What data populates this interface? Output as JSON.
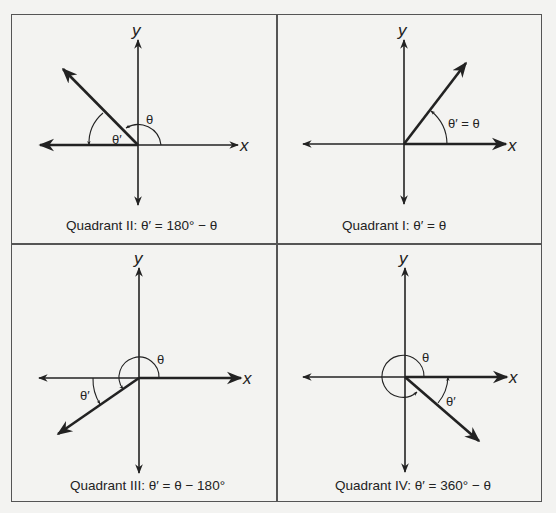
{
  "figure": {
    "panels": [
      {
        "id": "q2",
        "axis_x": "x",
        "axis_y": "y",
        "theta_label": "θ",
        "theta_prime_label": "θ′",
        "caption": "Quadrant II: θ′ = 180° − θ"
      },
      {
        "id": "q1",
        "axis_x": "x",
        "axis_y": "y",
        "angle_label": "θ′ = θ",
        "caption": "Quadrant I: θ′ = θ"
      },
      {
        "id": "q3",
        "axis_x": "x",
        "axis_y": "y",
        "theta_label": "θ",
        "theta_prime_label": "θ′",
        "caption": "Quadrant III: θ′ = θ − 180°"
      },
      {
        "id": "q4",
        "axis_x": "x",
        "axis_y": "y",
        "theta_label": "θ",
        "theta_prime_label": "θ′",
        "caption": "Quadrant IV: θ′ = 360° − θ"
      }
    ]
  },
  "colors": {
    "line": "#222222",
    "border": "#555555",
    "background": "#f3f3f1"
  }
}
